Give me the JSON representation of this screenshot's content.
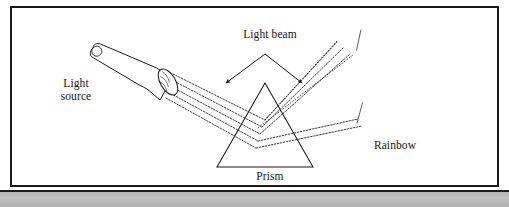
{
  "figure": {
    "background_color": "#ffffff",
    "border_color": "#1a1a1a",
    "bottom_bar_color": "#b8b8b8",
    "labels": {
      "light_source": "Light\nsource",
      "light_beam": "Light beam",
      "prism": "Prism",
      "rainbow": "Rainbow"
    },
    "elements": {
      "flashlight": {
        "name": "Light source",
        "fill": "#ffffff",
        "stroke": "#1a1a1a"
      },
      "prism": {
        "name": "Prism",
        "shape": "triangle",
        "fill": "none",
        "stroke": "#1a1a1a"
      },
      "rainbow": {
        "name": "Rainbow",
        "shape": "semicircular arc",
        "gradient_dark": "#0d0d0d",
        "gradient_light": "#f2f2f2"
      },
      "light_beam": {
        "name": "Light beam",
        "ray_count": 5,
        "stroke": "#1a1a1a",
        "style": "dotted"
      }
    }
  }
}
